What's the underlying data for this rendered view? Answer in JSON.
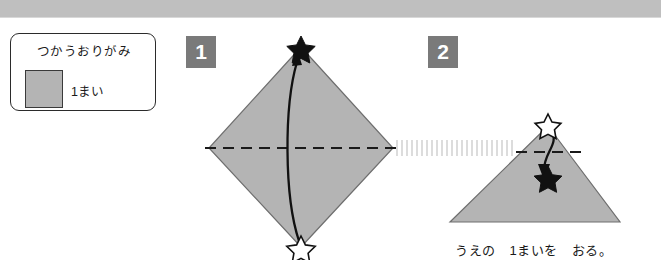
{
  "page": {
    "language": "ja",
    "background_color": "#ffffff",
    "header_band_color": "#bfbfbf",
    "paper_fill_color": "#b4b4b4",
    "paper_edge_color": "#6e6e6e",
    "badge_color": "#7a7a7a",
    "ink_color": "#1a1a1a"
  },
  "legend": {
    "title": "つかうおりがみ",
    "swatch_name": "origami-paper-swatch",
    "swatch_color": "#b4b4b4",
    "count_label": "1まい"
  },
  "steps": [
    {
      "number": "1",
      "shape": "diamond",
      "start_marker": "hollow-star",
      "end_marker": "filled-star",
      "fold_line": "horizontal-dashed",
      "arrow_direction": "bottom-to-top",
      "caption": ""
    },
    {
      "number": "2",
      "shape": "triangle",
      "start_marker": "hollow-star",
      "end_marker": "filled-star",
      "fold_line": "horizontal-dashed",
      "arrow_direction": "top-to-bottom",
      "caption": "うえの　1まいを　おる。"
    }
  ],
  "caption": {
    "text": "うえの　1まいを　おる。"
  }
}
